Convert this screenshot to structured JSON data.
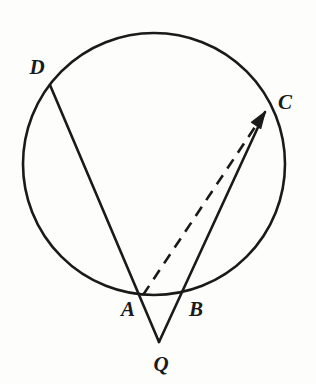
{
  "figure": {
    "background_color": "#fdfdfc",
    "stroke_color": "#1a1a1a",
    "width": 316,
    "height": 384
  },
  "circle": {
    "center_x": 154,
    "center_y": 164,
    "radius": 131,
    "stroke_width": 2.6,
    "fill": "none"
  },
  "points": [
    {
      "id": "D",
      "label": "D",
      "x": 50,
      "y": 85,
      "label_x": 37,
      "label_y": 67,
      "on_circle": true
    },
    {
      "id": "C",
      "label": "C",
      "x": 265,
      "y": 112,
      "label_x": 285,
      "label_y": 102,
      "on_circle": true
    },
    {
      "id": "A",
      "label": "A",
      "x": 143,
      "y": 295,
      "label_x": 128,
      "label_y": 309,
      "on_circle": true
    },
    {
      "id": "B",
      "label": "B",
      "x": 185,
      "y": 295,
      "label_x": 196,
      "label_y": 309,
      "on_circle": true
    },
    {
      "id": "Q",
      "label": "Q",
      "x": 159,
      "y": 342,
      "label_x": 161,
      "label_y": 364,
      "on_circle": false
    }
  ],
  "segments": [
    {
      "id": "DQ",
      "from": "D",
      "to": "Q",
      "style": "solid",
      "stroke_width": 2.6,
      "arrow": false,
      "description": "secant from D through A to external point Q"
    },
    {
      "id": "CQ",
      "from": "C",
      "to": "Q",
      "style": "solid",
      "stroke_width": 2.6,
      "arrow": false,
      "description": "secant from C through B to external point Q"
    },
    {
      "id": "AC",
      "from": "A",
      "to": "C",
      "style": "dashed",
      "stroke_width": 2.6,
      "arrow": true,
      "dash_pattern": "11 8",
      "description": "dashed auxiliary chord from A to C with arrowhead at C"
    }
  ],
  "labels": {
    "D": "D",
    "C": "C",
    "A": "A",
    "B": "B",
    "Q": "Q"
  }
}
